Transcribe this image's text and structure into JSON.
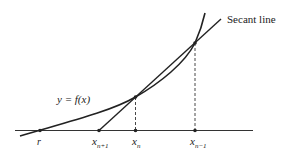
{
  "diagram": {
    "colors": {
      "stroke": "#222222",
      "background": "#ffffff"
    },
    "labels": {
      "secant_line": "Secant line",
      "function": "y = f(x)",
      "root": "r",
      "x_next_base": "x",
      "x_next_sub": "n+1",
      "x_curr_base": "x",
      "x_curr_sub": "n",
      "x_prev_base": "x",
      "x_prev_sub": "n−1"
    },
    "points": [
      {
        "name": "r",
        "x": 40,
        "y": 130.5
      },
      {
        "name": "x_{n+1}",
        "x": 99,
        "y": 130.5
      },
      {
        "name": "x_n",
        "x": 135.5,
        "y": 130.5
      },
      {
        "name": "x_{n-1}",
        "x": 195,
        "y": 130.5
      },
      {
        "name": "f(x_n)",
        "x": 135.5,
        "y": 97
      },
      {
        "name": "f(x_{n-1})",
        "x": 195,
        "y": 43
      }
    ]
  }
}
